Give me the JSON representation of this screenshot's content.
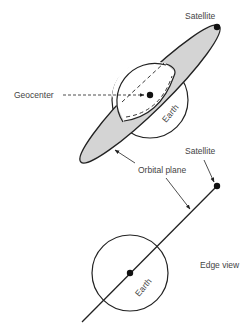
{
  "diagram": {
    "top_view": {
      "satellite_label": "Satellite",
      "geocenter_label": "Geocenter",
      "earth_label": "Earth"
    },
    "shared": {
      "orbital_plane_label": "Orbital plane"
    },
    "edge_view": {
      "satellite_label": "Satellite",
      "earth_label": "Earth",
      "view_label": "Edge view"
    },
    "colors": {
      "stroke": "#222222",
      "plane_fill": "#d4d4d4",
      "text": "#444444"
    }
  }
}
